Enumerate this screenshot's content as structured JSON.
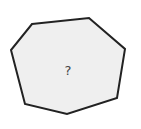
{
  "diagram": {
    "shape": "heptagon",
    "vertices": [
      [
        32,
        24
      ],
      [
        89,
        18
      ],
      [
        125,
        49
      ],
      [
        117,
        98
      ],
      [
        67,
        114
      ],
      [
        25,
        104
      ],
      [
        11,
        50
      ]
    ],
    "fill_color": "#efefef",
    "stroke_color": "#222222",
    "stroke_width": 2,
    "label": "?",
    "label_color": "#444444",
    "label_position": [
      68,
      70
    ]
  }
}
